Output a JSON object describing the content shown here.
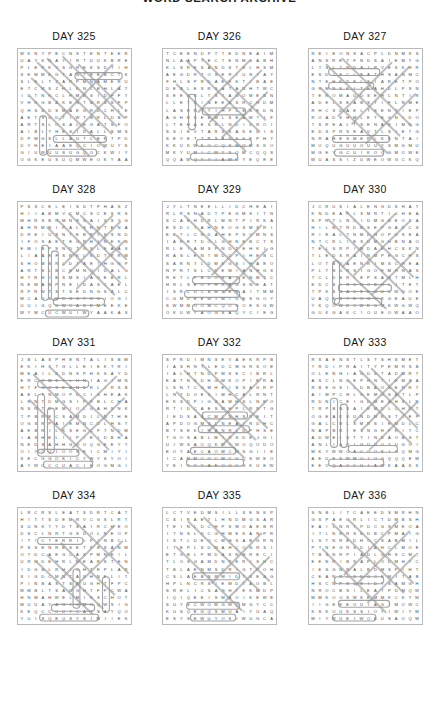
{
  "document": {
    "title": "WORD SEARCH ARCHIVE",
    "title_clipped": true
  },
  "grid_spec": {
    "columns": 16,
    "rows": 16,
    "alphabet": "ABCDEFGHIJKLMNOPQRSTUVWXYZ"
  },
  "layout": {
    "puzzles_per_row": 3,
    "puzzle_rows": 4,
    "total_puzzles": 12
  },
  "puzzles": [
    {
      "label": "DAY 325",
      "letters": "WKNYPECNSTENTEERUAYKNAYIRTUUKBREPLEPKVSGREKSDTIHSEMMEGTANTEEBCTKSLELTZARPMNAMERUETCMSZHLKNLEHLATIDTNKCLHMBSIDFFTVHNGBAKENTMRSSFPQHSBDSMAEGRDCHLEAETSGDTIWTBRLDBPARTSLOSALEGATSFOAIBLTHESIDALLSMSDPMGSLLAUTLEKTPDDYH",
      "marks": [
        {
          "type": "line",
          "x1": 20,
          "y1": 14,
          "x2": 95,
          "y2": 86
        },
        {
          "type": "line",
          "x1": 30,
          "y1": 10,
          "x2": 100,
          "y2": 78
        },
        {
          "type": "line",
          "x1": 14,
          "y1": 30,
          "x2": 88,
          "y2": 100
        },
        {
          "type": "line",
          "x1": 46,
          "y1": 8,
          "x2": 108,
          "y2": 70
        },
        {
          "type": "line",
          "x1": 12,
          "y1": 48,
          "x2": 72,
          "y2": 108
        },
        {
          "type": "line",
          "x1": 62,
          "y1": 16,
          "x2": 106,
          "y2": 60
        },
        {
          "type": "line",
          "x1": 96,
          "y1": 16,
          "x2": 42,
          "y2": 72
        },
        {
          "type": "line",
          "x1": 104,
          "y1": 38,
          "x2": 56,
          "y2": 86
        },
        {
          "type": "box",
          "x": 58,
          "y": 24,
          "w": 48,
          "h": 7
        },
        {
          "type": "box",
          "x": 22,
          "y": 68,
          "w": 7,
          "h": 40
        },
        {
          "type": "box",
          "x": 36,
          "y": 88,
          "w": 54,
          "h": 7
        },
        {
          "type": "box",
          "x": 30,
          "y": 102,
          "w": 50,
          "h": 7
        }
      ]
    },
    {
      "label": "DAY 326",
      "letters": "TCEENDPTTEDNEAIMNLAAPTECTENMSABHKLSRESANDSTELHSMAEGDRTOSERIUNTAYFHLSPRDAEEKTIBAEDEALESRSATANHTWCSEEDRLTSTAGOMEBNLLETRINEEASRCHDMLASENTTIHPLESEDNAGHRSEEMLSEAWTIFLTEHAESRLNDIDROISSIEVTARSSAKEDISSEVETTRSAGSKEP",
      "marks": [
        {
          "type": "line",
          "x1": 24,
          "y1": 12,
          "x2": 98,
          "y2": 84
        },
        {
          "type": "line",
          "x1": 40,
          "y1": 10,
          "x2": 104,
          "y2": 72
        },
        {
          "type": "line",
          "x1": 14,
          "y1": 36,
          "x2": 84,
          "y2": 104
        },
        {
          "type": "line",
          "x1": 100,
          "y1": 22,
          "x2": 48,
          "y2": 74
        },
        {
          "type": "line",
          "x1": 106,
          "y1": 44,
          "x2": 60,
          "y2": 90
        },
        {
          "type": "line",
          "x1": 88,
          "y1": 12,
          "x2": 36,
          "y2": 64
        },
        {
          "type": "box",
          "x": 40,
          "y": 60,
          "w": 44,
          "h": 7
        },
        {
          "type": "box",
          "x": 26,
          "y": 46,
          "w": 7,
          "h": 36
        },
        {
          "type": "box",
          "x": 34,
          "y": 92,
          "w": 56,
          "h": 7
        },
        {
          "type": "box",
          "x": 28,
          "y": 106,
          "w": 48,
          "h": 7
        }
      ]
    },
    {
      "label": "DAY 327",
      "letters": "REIEONSACPLDNMKSANSRETFNDSAIEMTGLTSLTNDAIRVESKHRESDIFCLEATHSANMCNTEHKDELSIARETPOGRMNSKITEAHDLPSNTEROMAUDSEHLNTIRADELSEABSTIFLNMERHCSDAELTSENTIEPROADSHMLETEGNIDOTSREALTSENAEIMNGEDSPRSEAVTLSIETGNRAHESMEPLKDNTA",
      "marks": [
        {
          "type": "line",
          "x1": 18,
          "y1": 16,
          "x2": 92,
          "y2": 88
        },
        {
          "type": "line",
          "x1": 34,
          "y1": 10,
          "x2": 104,
          "y2": 78
        },
        {
          "type": "line",
          "x1": 12,
          "y1": 40,
          "x2": 80,
          "y2": 106
        },
        {
          "type": "line",
          "x1": 102,
          "y1": 18,
          "x2": 44,
          "y2": 76
        },
        {
          "type": "line",
          "x1": 108,
          "y1": 46,
          "x2": 58,
          "y2": 96
        },
        {
          "type": "line",
          "x1": 84,
          "y1": 14,
          "x2": 30,
          "y2": 68
        },
        {
          "type": "box",
          "x": 20,
          "y": 20,
          "w": 52,
          "h": 7
        },
        {
          "type": "box",
          "x": 20,
          "y": 34,
          "w": 46,
          "h": 7
        },
        {
          "type": "box",
          "x": 24,
          "y": 88,
          "w": 58,
          "h": 7
        },
        {
          "type": "box",
          "x": 26,
          "y": 102,
          "w": 50,
          "h": 7
        }
      ]
    },
    {
      "label": "DAY 328",
      "letters": "PSSCELEISDTPHASZHIIABMVCMCSCESRSMHRSBRMNRSAIXSYGAHRMBIPALSHNTENADREIUSNTEBRTSSNDIFOSAETEGRHINEKNEMIBPSNDTGSLEAASLIAAEFSRKLNDTPRMSHOMSRLDTAEIHGNPARTSLBCEMNOIDALGHTRHIESMSIAOEBRLNEMASPNEIDASCAELRPRWTSTSEDNGSA",
      "marks": [
        {
          "type": "line",
          "x1": 52,
          "y1": 12,
          "x2": 108,
          "y2": 68
        },
        {
          "type": "line",
          "x1": 40,
          "y1": 18,
          "x2": 104,
          "y2": 82
        },
        {
          "type": "line",
          "x1": 30,
          "y1": 26,
          "x2": 98,
          "y2": 94
        },
        {
          "type": "line",
          "x1": 64,
          "y1": 14,
          "x2": 110,
          "y2": 58
        },
        {
          "type": "line",
          "x1": 104,
          "y1": 20,
          "x2": 52,
          "y2": 72
        },
        {
          "type": "line",
          "x1": 108,
          "y1": 40,
          "x2": 60,
          "y2": 88
        },
        {
          "type": "line",
          "x1": 96,
          "y1": 14,
          "x2": 46,
          "y2": 64
        },
        {
          "type": "box",
          "x": 24,
          "y": 44,
          "w": 7,
          "h": 56
        },
        {
          "type": "box",
          "x": 34,
          "y": 50,
          "w": 7,
          "h": 50
        },
        {
          "type": "box",
          "x": 36,
          "y": 98,
          "w": 52,
          "h": 7
        },
        {
          "type": "box",
          "x": 28,
          "y": 110,
          "w": 44,
          "h": 7
        }
      ]
    },
    {
      "label": "DAY 329",
      "letters": "JYLTNEELLIDCHEAIRLRSNADTPEGMSITNSCAEHDRLMNTPIRKAESDLTAHNEOGSMSRIEBTLCNDAHEPSVMNSIARETDOLGHNEBCTSRLEIAMSPNDTEHKIGRASLENTMDOPIHEBCSARNTLDMEGSIHAEONPRTSLCDEMIANHGSRETLPBDOSAIENMTCHRLSEOPHRAGSNEATISRLDCBMSENAIT",
      "marks": [
        {
          "type": "line",
          "x1": 22,
          "y1": 14,
          "x2": 94,
          "y2": 84
        },
        {
          "type": "line",
          "x1": 36,
          "y1": 12,
          "x2": 104,
          "y2": 78
        },
        {
          "type": "line",
          "x1": 14,
          "y1": 34,
          "x2": 82,
          "y2": 100
        },
        {
          "type": "line",
          "x1": 100,
          "y1": 24,
          "x2": 50,
          "y2": 74
        },
        {
          "type": "line",
          "x1": 106,
          "y1": 48,
          "x2": 62,
          "y2": 92
        },
        {
          "type": "box",
          "x": 30,
          "y": 76,
          "w": 48,
          "h": 7
        },
        {
          "type": "box",
          "x": 22,
          "y": 90,
          "w": 56,
          "h": 7
        },
        {
          "type": "box",
          "x": 30,
          "y": 104,
          "w": 46,
          "h": 7
        }
      ]
    },
    {
      "label": "DAY 330",
      "letters": "JCRUSIALENGDSHATKNDEAPLSMRTICHEASPRTLNCIDMGBEOSAHILNTRDMSEPGAKCSRIEALTNMDHOPUSEANTCRLIESDMGHBNAOTELSRPIMDAEHCSKNTLEDSRAINMPEGCHSLOTBDAENRIMSCHEAPLTNDRSIGOEMHNASTCLDBRIEPSANTMLHEDCSIRGNOBHLITETTPKSGAUE",
      "marks": [
        {
          "type": "line",
          "x1": 20,
          "y1": 18,
          "x2": 96,
          "y2": 92
        },
        {
          "type": "line",
          "x1": 38,
          "y1": 10,
          "x2": 106,
          "y2": 76
        },
        {
          "type": "line",
          "x1": 12,
          "y1": 44,
          "x2": 78,
          "y2": 108
        },
        {
          "type": "line",
          "x1": 102,
          "y1": 20,
          "x2": 46,
          "y2": 74
        },
        {
          "type": "line",
          "x1": 108,
          "y1": 50,
          "x2": 64,
          "y2": 94
        },
        {
          "type": "line",
          "x1": 88,
          "y1": 12,
          "x2": 34,
          "y2": 66
        },
        {
          "type": "box",
          "x": 24,
          "y": 60,
          "w": 7,
          "h": 44
        },
        {
          "type": "box",
          "x": 30,
          "y": 84,
          "w": 54,
          "h": 7
        },
        {
          "type": "box",
          "x": 26,
          "y": 98,
          "w": 48,
          "h": 7
        }
      ]
    },
    {
      "label": "DAY 331",
      "letters": "JBLASPHENTALISBMEKIHTTGLLEIEKTRIMEAILEDNSPHKSAYDERCOMSTLHNIAGIMNHTFGCSEANDRLIRSBAELTNMOPDCISHEAKLRNTDMGSIPEBLCHANSRTDEMIOLGAHSNKTPBRECSAMDILNTHEOGSRPAIEMNCDLHSTAEBRILKSEGCPTNDMIASHELIIPIEIDBHANEDSAH",
      "marks": [
        {
          "type": "line",
          "x1": 16,
          "y1": 20,
          "x2": 92,
          "y2": 96
        },
        {
          "type": "line",
          "x1": 32,
          "y1": 12,
          "x2": 106,
          "y2": 82
        },
        {
          "type": "line",
          "x1": 12,
          "y1": 46,
          "x2": 76,
          "y2": 108
        },
        {
          "type": "line",
          "x1": 100,
          "y1": 22,
          "x2": 44,
          "y2": 76
        },
        {
          "type": "line",
          "x1": 108,
          "y1": 44,
          "x2": 56,
          "y2": 94
        },
        {
          "type": "box",
          "x": 20,
          "y": 26,
          "w": 52,
          "h": 7
        },
        {
          "type": "box",
          "x": 20,
          "y": 40,
          "w": 7,
          "h": 60
        },
        {
          "type": "box",
          "x": 30,
          "y": 54,
          "w": 7,
          "h": 46
        },
        {
          "type": "box",
          "x": 20,
          "y": 96,
          "w": 42,
          "h": 7
        },
        {
          "type": "box",
          "x": 26,
          "y": 108,
          "w": 50,
          "h": 7
        }
      ]
    },
    {
      "label": "DAY 332",
      "letters": "SPRDIMNSEVAEKRPBIASHNTLEDCMGRSOEIALHTNDPMSECIBRLEATNSDHGMKOPIERALSNTCDMHEIBSAGRPLNTDOESIMHCALRNTEKSDPIGBAMHSLNEORTIDCAESMHPLRNTGIEDSABCMLNHSREITAPDOGMSLNEAIRDHCBTSEKIMANRLDPHSETGOSABLMIRSDEJG",
      "marks": [
        {
          "type": "line",
          "x1": 22,
          "y1": 16,
          "x2": 94,
          "y2": 86
        },
        {
          "type": "line",
          "x1": 40,
          "y1": 10,
          "x2": 106,
          "y2": 74
        },
        {
          "type": "line",
          "x1": 14,
          "y1": 38,
          "x2": 82,
          "y2": 104
        },
        {
          "type": "line",
          "x1": 100,
          "y1": 24,
          "x2": 48,
          "y2": 76
        },
        {
          "type": "line",
          "x1": 106,
          "y1": 46,
          "x2": 60,
          "y2": 92
        },
        {
          "type": "box",
          "x": 40,
          "y": 58,
          "w": 46,
          "h": 7
        },
        {
          "type": "box",
          "x": 36,
          "y": 72,
          "w": 52,
          "h": 7
        },
        {
          "type": "box",
          "x": 28,
          "y": 94,
          "w": 46,
          "h": 7
        },
        {
          "type": "box",
          "x": 24,
          "y": 106,
          "w": 58,
          "h": 7
        }
      ]
    },
    {
      "label": "DAY 333",
      "letters": "RSAENSTLSTSHSMETTRDIPRAITYPEMRSBOLENHIAGDSTADMRTASCLNDEPHNTIEMSARBEGSILDBAOSENRTAIMPCHLGEMOSATLPRDNICEIGDMEAHSLNTRPBNSAIEMDLCHRTOGEAKSUNDMRSTIEPGALCRLSMRSIEMDLCNAPBRIESNGHPRITCADWELSTYINDAOBSTAN",
      "marks": [
        {
          "type": "line",
          "x1": 52,
          "y1": 16,
          "x2": 110,
          "y2": 74
        },
        {
          "type": "line",
          "x1": 40,
          "y1": 26,
          "x2": 104,
          "y2": 90
        },
        {
          "type": "line",
          "x1": 64,
          "y1": 14,
          "x2": 112,
          "y2": 62
        },
        {
          "type": "line",
          "x1": 104,
          "y1": 26,
          "x2": 54,
          "y2": 76
        },
        {
          "type": "line",
          "x1": 110,
          "y1": 48,
          "x2": 62,
          "y2": 96
        },
        {
          "type": "line",
          "x1": 96,
          "y1": 18,
          "x2": 46,
          "y2": 68
        },
        {
          "type": "box",
          "x": 22,
          "y": 44,
          "w": 7,
          "h": 50
        },
        {
          "type": "box",
          "x": 32,
          "y": 50,
          "w": 7,
          "h": 44
        },
        {
          "type": "box",
          "x": 40,
          "y": 92,
          "w": 50,
          "h": 7
        },
        {
          "type": "box",
          "x": 20,
          "y": 106,
          "w": 56,
          "h": 7
        }
      ]
    },
    {
      "label": "DAY 334",
      "letters": "LRCRSLEATSDRTCATHITTSDEMRVCGSLRTSUNKTYDTSAIRCHEODSCLNRTGSDOLNEOPITICTERRILPINBCLPSSENRESETPBSANMOTDCAEGCASPMNEILURMDEHRLMEARSTENIDGBLRHICHTEPLARSIGDCMNTASHNELITPINBASTSAUGHTFPCWMBLTSAUGHTFPCWAHNMAHWELMIESCHOT",
      "marks": [
        {
          "type": "line",
          "x1": 56,
          "y1": 12,
          "x2": 112,
          "y2": 66
        },
        {
          "type": "line",
          "x1": 20,
          "y1": 56,
          "x2": 76,
          "y2": 108
        },
        {
          "type": "line",
          "x1": 30,
          "y1": 48,
          "x2": 86,
          "y2": 102
        },
        {
          "type": "line",
          "x1": 44,
          "y1": 36,
          "x2": 98,
          "y2": 88
        },
        {
          "type": "line",
          "x1": 98,
          "y1": 18,
          "x2": 44,
          "y2": 72
        },
        {
          "type": "line",
          "x1": 106,
          "y1": 34,
          "x2": 54,
          "y2": 84
        },
        {
          "type": "box",
          "x": 20,
          "y": 30,
          "w": 46,
          "h": 7
        },
        {
          "type": "box",
          "x": 56,
          "y": 62,
          "w": 7,
          "h": 40
        },
        {
          "type": "box",
          "x": 86,
          "y": 70,
          "w": 7,
          "h": 36
        },
        {
          "type": "box",
          "x": 34,
          "y": 98,
          "w": 44,
          "h": 7
        },
        {
          "type": "box",
          "x": 22,
          "y": 108,
          "w": 60,
          "h": 7
        }
      ]
    },
    {
      "label": "DAY 335",
      "letters": "LCTVEDMSILLSENKPCSIRAETLHNDMGSARTEINLDCHPSMOAEBRITNSLDCGHMEKANPRISTLDEOCMHSABGRNITEPLSDMAHCONRSIETGBLPMDASNHRECITLOSGAMDNPERISHCTBLAENMSDRIGTPOHCSLAEBNRMIDTSEAGHPLNCRSIEMDTAOBLSRELICSAGHTEKMD",
      "marks": [
        {
          "type": "line",
          "x1": 26,
          "y1": 14,
          "x2": 98,
          "y2": 84
        },
        {
          "type": "line",
          "x1": 42,
          "y1": 10,
          "x2": 108,
          "y2": 74
        },
        {
          "type": "line",
          "x1": 14,
          "y1": 40,
          "x2": 80,
          "y2": 104
        },
        {
          "type": "line",
          "x1": 100,
          "y1": 26,
          "x2": 50,
          "y2": 76
        },
        {
          "type": "line",
          "x1": 108,
          "y1": 50,
          "x2": 64,
          "y2": 94
        },
        {
          "type": "box",
          "x": 30,
          "y": 66,
          "w": 48,
          "h": 7
        },
        {
          "type": "box",
          "x": 24,
          "y": 96,
          "w": 54,
          "h": 7
        },
        {
          "type": "box",
          "x": 28,
          "y": 108,
          "w": 46,
          "h": 7
        }
      ]
    },
    {
      "label": "DAY 336",
      "letters": "SNBLITCAEEDSMRHNGSPAEORLICTDMBSHEAILNRTPDCGSMEOAITLNHRSEDBCPMAIGLSTNREDHOCSABMILPTNEGRSDIAHCLMOETBSNRPIADLGHSCMTEENRIBSAPLODMHTCIESGNRALBDMSPIHTCEANRLSDGOEMITABHSCNPRLEIDTSAMGHNROCBSILEATPDM",
      "marks": [
        {
          "type": "line",
          "x1": 24,
          "y1": 16,
          "x2": 96,
          "y2": 86
        },
        {
          "type": "line",
          "x1": 40,
          "y1": 12,
          "x2": 106,
          "y2": 76
        },
        {
          "type": "line",
          "x1": 14,
          "y1": 42,
          "x2": 78,
          "y2": 106
        },
        {
          "type": "line",
          "x1": 102,
          "y1": 24,
          "x2": 48,
          "y2": 78
        },
        {
          "type": "line",
          "x1": 108,
          "y1": 48,
          "x2": 60,
          "y2": 96
        },
        {
          "type": "line",
          "x1": 90,
          "y1": 14,
          "x2": 36,
          "y2": 68
        },
        {
          "type": "box",
          "x": 26,
          "y": 70,
          "w": 50,
          "h": 7
        },
        {
          "type": "box",
          "x": 30,
          "y": 94,
          "w": 52,
          "h": 7
        },
        {
          "type": "box",
          "x": 24,
          "y": 108,
          "w": 44,
          "h": 7
        }
      ]
    }
  ]
}
